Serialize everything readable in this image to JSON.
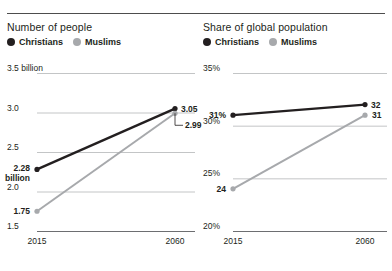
{
  "charts": [
    {
      "title": "Number of people",
      "legend": [
        {
          "label": "Christians",
          "color": "#231f20",
          "key": "christians"
        },
        {
          "label": "Muslims",
          "color": "#a7a9ac",
          "key": "muslims"
        }
      ],
      "chart_data": {
        "type": "line",
        "title": "Number of people",
        "xlabel": "",
        "ylabel": "",
        "categories": [
          "2015",
          "2060"
        ],
        "x": [
          2015,
          2060
        ],
        "ylim": [
          1.5,
          3.5
        ],
        "yticks": [
          "1.5",
          "2.0",
          "2.5",
          "3.0",
          "3.5 billion"
        ],
        "ytick_values": [
          1.5,
          2.0,
          2.5,
          3.0,
          3.5
        ],
        "grid": true,
        "legend_position": "top-left",
        "series": [
          {
            "name": "Christians",
            "color": "#231f20",
            "values": [
              2.28,
              3.05
            ],
            "point_labels": [
              "2.28\nbillion",
              "3.05"
            ]
          },
          {
            "name": "Muslims",
            "color": "#a7a9ac",
            "values": [
              1.75,
              2.99
            ],
            "point_labels": [
              "1.75",
              "2.99"
            ]
          }
        ]
      }
    },
    {
      "title": "Share of global population",
      "legend": [
        {
          "label": "Christians",
          "color": "#231f20",
          "key": "christians"
        },
        {
          "label": "Muslims",
          "color": "#a7a9ac",
          "key": "muslims"
        }
      ],
      "chart_data": {
        "type": "line",
        "title": "Share of global population",
        "xlabel": "",
        "ylabel": "",
        "categories": [
          "2015",
          "2060"
        ],
        "x": [
          2015,
          2060
        ],
        "ylim": [
          20,
          35
        ],
        "yticks": [
          "20%",
          "25%",
          "30%",
          "35%"
        ],
        "ytick_values": [
          20,
          25,
          30,
          35
        ],
        "grid": true,
        "legend_position": "top-left",
        "series": [
          {
            "name": "Christians",
            "color": "#231f20",
            "values": [
              31,
              32
            ],
            "point_labels": [
              "31%",
              "32"
            ]
          },
          {
            "name": "Muslims",
            "color": "#a7a9ac",
            "values": [
              24,
              31
            ],
            "point_labels": [
              "24",
              "31"
            ]
          }
        ]
      }
    }
  ]
}
